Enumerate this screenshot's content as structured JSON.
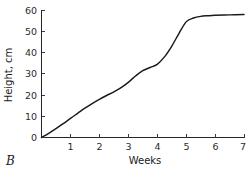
{
  "chart_data": {
    "type": "line",
    "title": "",
    "panel_label": "B",
    "xlabel": "Weeks",
    "ylabel": "Height, cm",
    "xlim": [
      0,
      7
    ],
    "ylim": [
      0,
      60
    ],
    "grid": false,
    "legend": "none",
    "xticks": [
      "1",
      "2",
      "3",
      "4",
      "5",
      "6",
      "7"
    ],
    "xtick_values": [
      1,
      2,
      3,
      4,
      5,
      6,
      7
    ],
    "yticks": [
      "0",
      "10",
      "20",
      "30",
      "40",
      "50",
      "60"
    ],
    "ytick_values": [
      0,
      10,
      20,
      30,
      40,
      50,
      60
    ],
    "series": [
      {
        "name": "Height",
        "x": [
          0,
          0.25,
          0.5,
          0.75,
          1,
          1.25,
          1.5,
          1.75,
          2,
          2.25,
          2.5,
          2.75,
          3,
          3.25,
          3.5,
          3.75,
          4,
          4.25,
          4.5,
          4.75,
          5,
          5.25,
          5.5,
          5.75,
          6,
          6.5,
          7
        ],
        "y": [
          0,
          2,
          4.2,
          6.5,
          9,
          11.4,
          13.8,
          16,
          18,
          19.8,
          21.5,
          23.5,
          26,
          29,
          31.5,
          33,
          34.5,
          38,
          43,
          49,
          54.5,
          56.3,
          57.1,
          57.4,
          57.6,
          57.8,
          58
        ]
      }
    ]
  },
  "axes": {
    "y_axis_name": "y-axis",
    "x_axis_name": "x-axis"
  }
}
